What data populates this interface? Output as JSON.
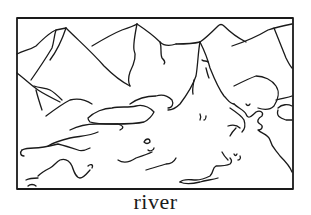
{
  "illustration": {
    "subject": "river",
    "description": "Black-and-white line drawing of mountains with a river flowing down from a peak into a valley",
    "stroke_color": "#1a1a1a",
    "background_color": "#ffffff"
  },
  "caption": {
    "text": "river"
  }
}
